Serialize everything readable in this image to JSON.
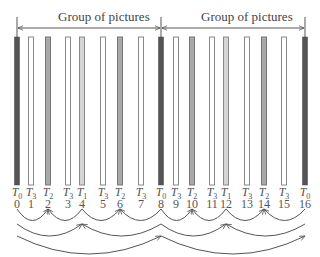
{
  "diagram": {
    "group_label": "Group of pictures",
    "groups": [
      {
        "label": "Group of pictures",
        "start_frame": 0,
        "end_frame": 8
      },
      {
        "label": "Group of pictures",
        "start_frame": 8,
        "end_frame": 16
      }
    ],
    "frames": [
      {
        "index": "0",
        "layer": "T",
        "sub": "0",
        "x": 17,
        "fill": "#555555",
        "stroke": "#444444"
      },
      {
        "index": "1",
        "layer": "T",
        "sub": "3",
        "x": 31,
        "fill": "#ffffff",
        "stroke": "#888888"
      },
      {
        "index": "2",
        "layer": "T",
        "sub": "2",
        "x": 48,
        "fill": "#a8a8a8",
        "stroke": "#777777"
      },
      {
        "index": "3",
        "layer": "T",
        "sub": "3",
        "x": 68,
        "fill": "#ffffff",
        "stroke": "#888888"
      },
      {
        "index": "4",
        "layer": "T",
        "sub": "1",
        "x": 82,
        "fill": "#d4d4d4",
        "stroke": "#888888"
      },
      {
        "index": "5",
        "layer": "T",
        "sub": "3",
        "x": 103,
        "fill": "#ffffff",
        "stroke": "#888888"
      },
      {
        "index": "6",
        "layer": "T",
        "sub": "2",
        "x": 120,
        "fill": "#a8a8a8",
        "stroke": "#777777"
      },
      {
        "index": "7",
        "layer": "T",
        "sub": "3",
        "x": 141,
        "fill": "#ffffff",
        "stroke": "#888888"
      },
      {
        "index": "8",
        "layer": "T",
        "sub": "0",
        "x": 161,
        "fill": "#555555",
        "stroke": "#444444"
      },
      {
        "index": "9",
        "layer": "T",
        "sub": "3",
        "x": 176,
        "fill": "#ffffff",
        "stroke": "#888888"
      },
      {
        "index": "10",
        "layer": "T",
        "sub": "2",
        "x": 192,
        "fill": "#a8a8a8",
        "stroke": "#777777"
      },
      {
        "index": "11",
        "layer": "T",
        "sub": "3",
        "x": 212,
        "fill": "#ffffff",
        "stroke": "#888888"
      },
      {
        "index": "12",
        "layer": "T",
        "sub": "1",
        "x": 226,
        "fill": "#d4d4d4",
        "stroke": "#888888"
      },
      {
        "index": "13",
        "layer": "T",
        "sub": "3",
        "x": 247,
        "fill": "#ffffff",
        "stroke": "#888888"
      },
      {
        "index": "14",
        "layer": "T",
        "sub": "2",
        "x": 264,
        "fill": "#a8a8a8",
        "stroke": "#777777"
      },
      {
        "index": "15",
        "layer": "T",
        "sub": "3",
        "x": 284,
        "fill": "#ffffff",
        "stroke": "#888888"
      },
      {
        "index": "16",
        "layer": "T",
        "sub": "0",
        "x": 305,
        "fill": "#555555",
        "stroke": "#444444"
      }
    ],
    "prediction_arcs": [
      {
        "from": 0,
        "to": 2,
        "level": 1
      },
      {
        "from": 4,
        "to": 2,
        "level": 1
      },
      {
        "from": 4,
        "to": 6,
        "level": 1
      },
      {
        "from": 8,
        "to": 6,
        "level": 1
      },
      {
        "from": 8,
        "to": 10,
        "level": 1
      },
      {
        "from": 12,
        "to": 10,
        "level": 1
      },
      {
        "from": 12,
        "to": 14,
        "level": 1
      },
      {
        "from": 16,
        "to": 14,
        "level": 1
      },
      {
        "from": 0,
        "to": 4,
        "level": 2
      },
      {
        "from": 8,
        "to": 4,
        "level": 2
      },
      {
        "from": 8,
        "to": 12,
        "level": 2
      },
      {
        "from": 16,
        "to": 12,
        "level": 2
      },
      {
        "from": 0,
        "to": 8,
        "level": 3
      },
      {
        "from": 8,
        "to": 16,
        "level": 3
      }
    ],
    "colors": {
      "T0": "#555555",
      "T1": "#d4d4d4",
      "T2": "#a8a8a8",
      "T3": "#ffffff",
      "line": "#555555",
      "text": "#444444"
    }
  }
}
